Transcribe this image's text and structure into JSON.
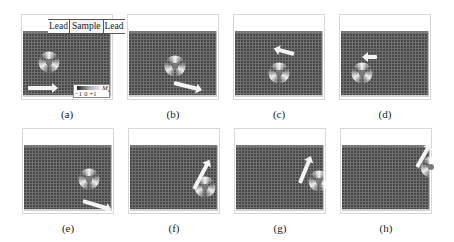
{
  "figure": {
    "panels": [
      {
        "id": "a",
        "label": "(a)",
        "x": 21,
        "y": 14,
        "vortex": {
          "x": 27,
          "y": 47
        },
        "arrow": {
          "x": 6,
          "y": 71,
          "len": 25,
          "angle": 0
        }
      },
      {
        "id": "b",
        "label": "(b)",
        "x": 127,
        "y": 14,
        "vortex": {
          "x": 47,
          "y": 51
        },
        "arrow": {
          "x": 46,
          "y": 66,
          "len": 24,
          "angle": 14
        }
      },
      {
        "id": "c",
        "label": "(c)",
        "x": 233,
        "y": 14,
        "vortex": {
          "x": 45,
          "y": 58
        },
        "arrow": {
          "x": 60,
          "y": 37,
          "len": 16,
          "angle": 195
        }
      },
      {
        "id": "d",
        "label": "(d)",
        "x": 339,
        "y": 14,
        "vortex": {
          "x": 22,
          "y": 58
        },
        "arrow": {
          "x": 37,
          "y": 40,
          "len": 10,
          "angle": 180
        }
      },
      {
        "id": "e",
        "label": "(e)",
        "x": 22,
        "y": 128,
        "vortex": {
          "x": 66,
          "y": 50
        },
        "arrow": {
          "x": 60,
          "y": 70,
          "len": 25,
          "angle": 17
        }
      },
      {
        "id": "f",
        "label": "(f)",
        "x": 128,
        "y": 128,
        "vortex": {
          "x": 76,
          "y": 58
        },
        "arrow": {
          "x": 65,
          "y": 58,
          "len": 28,
          "angle": -62
        }
      },
      {
        "id": "g",
        "label": "(g)",
        "x": 234,
        "y": 128,
        "vortex": {
          "x": 84,
          "y": 52
        },
        "arrow": {
          "x": 65,
          "y": 52,
          "len": 24,
          "angle": -68
        }
      },
      {
        "id": "h",
        "label": "(h)",
        "x": 340,
        "y": 128,
        "vortex": {
          "x": 90,
          "y": 38
        },
        "arrow": {
          "x": 76,
          "y": 36,
          "len": 22,
          "angle": -60
        }
      }
    ],
    "leads_header": {
      "left": "Lead",
      "center": "Sample",
      "right": "Lead"
    },
    "colorbar": {
      "label": "M",
      "subscript": "z",
      "ticks": "−1  0  +1"
    },
    "colors": {
      "track": "#6e6e6e",
      "arrow": "#f4f4f4",
      "vortex": "#ffffff"
    }
  }
}
